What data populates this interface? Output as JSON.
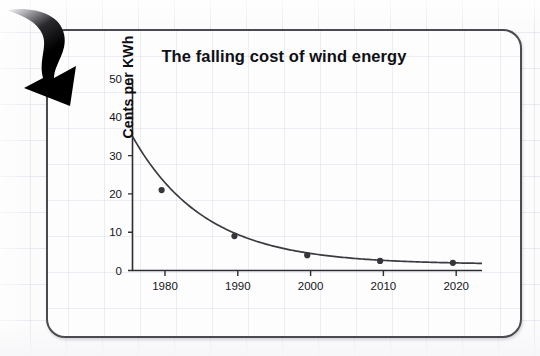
{
  "page": {
    "top_clipped_text": "",
    "background": "#fcfcfd",
    "grid_color": "#96a5c3"
  },
  "card": {
    "border_color": "#4a4a50",
    "background": "#fdfdfe",
    "corner_radius_px": 19
  },
  "annotation": {
    "arrow_icon_name": "curved-down-arrow-icon",
    "arrow_color": "#000000",
    "points_to": "chart-card-top-left"
  },
  "chart_data": {
    "type": "line",
    "title": "The falling cost of wind energy",
    "xlabel": "Year",
    "ylabel": "Cents per KWh",
    "x": [
      1980,
      1990,
      2000,
      2010,
      2020
    ],
    "values": [
      21,
      9,
      4,
      2.5,
      2
    ],
    "series": [
      {
        "name": "Cost of wind energy",
        "x": [
          1980,
          1990,
          2000,
          2010,
          2020
        ],
        "values": [
          21,
          9,
          4,
          2.5,
          2
        ]
      }
    ],
    "curve_start": {
      "x": 1976,
      "y": 35
    },
    "curve_end": {
      "x": 2024,
      "y": 1.9
    },
    "xlim": [
      1976,
      2024
    ],
    "ylim": [
      0,
      50
    ],
    "xticks": [
      1980,
      1990,
      2000,
      2010,
      2020
    ],
    "xticklabels": [
      "1980",
      "1990",
      "2000",
      "2010",
      "2020"
    ],
    "yticks": [
      0,
      10,
      20,
      30,
      40,
      50
    ],
    "yticklabels": [
      "0",
      "10",
      "20",
      "30",
      "40",
      "50"
    ],
    "grid": false,
    "legend": "none",
    "marker": "circle",
    "line_color": "#3a3a40",
    "marker_color": "#35353b"
  }
}
